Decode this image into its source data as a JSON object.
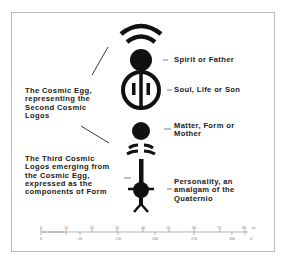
{
  "diagram": {
    "labels": {
      "spirit": "Spirit or Father",
      "soul": "Soul, Life or Son",
      "matter": "Matter, Form or\nMother",
      "personality": "Personality, an\namalgam of the\nQuaternio",
      "cosmic_egg": "The Cosmic Egg,\nrepresenting the\nSecond Cosmic\nLogos",
      "third_logos": "The Third Cosmic\nLogos emerging from\nthe Cosmic Egg,\nexpressed as the\ncomponents of Form"
    },
    "colors": {
      "ink": "#111111",
      "frame": "#bdbdbd",
      "text": "#202020"
    }
  },
  "scale_bar": {
    "top_ticks": [
      "0",
      "10",
      "20",
      "30",
      "40",
      "50",
      "60",
      "70",
      "80"
    ],
    "top_unit": "m",
    "bottom_ticks": [
      "0",
      "50",
      "150",
      "100",
      "250",
      "300"
    ],
    "bottom_unit": "ft"
  }
}
